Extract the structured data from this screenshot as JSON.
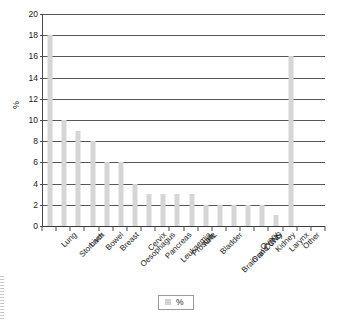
{
  "chart_data": {
    "type": "bar",
    "title": "",
    "xlabel": "",
    "ylabel": "%",
    "ylim": [
      0,
      20
    ],
    "ytick_step": 2,
    "yticks": [
      0,
      2,
      4,
      6,
      8,
      10,
      12,
      14,
      16,
      18,
      20
    ],
    "grid": true,
    "legend_position": "bottom-center",
    "series_name": "%",
    "bar_color": "#d6d6d6",
    "axis_color": "#4a4a4a",
    "gridline_color": "#575757",
    "trailing_empty_ticks": 2,
    "categories": [
      "Lung",
      "Stomach",
      "Liver",
      "Bowel",
      "Breast",
      "Oesophagus",
      "Cervix",
      "Pancreas",
      "Leukaemia",
      "Prostate",
      "NHL",
      "Bladder",
      "Brain and CNS",
      "Oral Cavity",
      "Ovary",
      "Kidney",
      "Larynx",
      "Other"
    ],
    "values": [
      18,
      10,
      9,
      8,
      6,
      6,
      4,
      3,
      3,
      3,
      3,
      2,
      2,
      2,
      2,
      2,
      1,
      16
    ],
    "series": [
      {
        "name": "%",
        "values": [
          18,
          10,
          9,
          8,
          6,
          6,
          4,
          3,
          3,
          3,
          3,
          2,
          2,
          2,
          2,
          2,
          1,
          16
        ]
      }
    ]
  },
  "legend": {
    "label": "%"
  },
  "axes": {
    "y_title": "%"
  }
}
